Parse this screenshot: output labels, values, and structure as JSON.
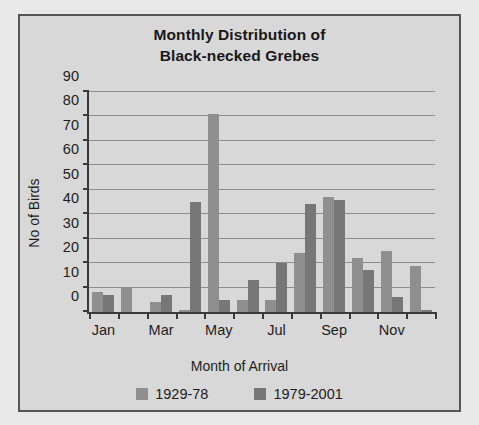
{
  "chart_data": {
    "type": "bar",
    "title": "Monthly Distribution of Black-necked Grebes",
    "title_lines": [
      "Monthly Distribution of",
      "Black-necked Grebes"
    ],
    "xlabel": "Month of Arrival",
    "ylabel": "No of Birds",
    "ylim": [
      0,
      90
    ],
    "ytick_step": 10,
    "yticks": [
      0,
      10,
      20,
      30,
      40,
      50,
      60,
      70,
      80,
      90
    ],
    "grid": true,
    "legend_position": "bottom",
    "categories": [
      "Jan",
      "Feb",
      "Mar",
      "Apr",
      "May",
      "Jun",
      "Jul",
      "Aug",
      "Sep",
      "Oct",
      "Nov",
      "Dec"
    ],
    "tick_labels_shown": [
      "Jan",
      "",
      "Mar",
      "",
      "May",
      "",
      "Jul",
      "",
      "Sep",
      "",
      "Nov",
      ""
    ],
    "series": [
      {
        "name": "1929-78",
        "color": "#8f8f8f",
        "values": [
          8,
          10,
          4,
          1,
          81,
          5,
          5,
          24,
          47,
          22,
          25,
          19
        ]
      },
      {
        "name": "1979-2001",
        "color": "#777777",
        "values": [
          7,
          0,
          7,
          45,
          5,
          13,
          20,
          44,
          46,
          17,
          6,
          1
        ]
      }
    ]
  },
  "colors": {
    "figure_background": "#d8d8d8",
    "page_background": "#e9e9e9",
    "axis": "#3a3a3a",
    "gridline": "#8d8d8d",
    "text": "#1d1d1d"
  }
}
